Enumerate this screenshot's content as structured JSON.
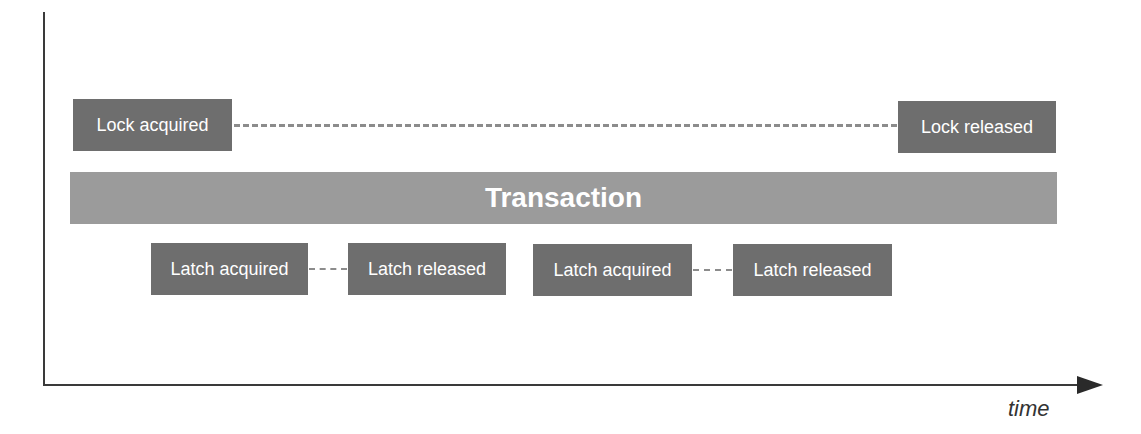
{
  "diagram": {
    "axis": {
      "x_label": "time"
    },
    "transaction": {
      "label": "Transaction"
    },
    "lock": {
      "acquired": "Lock acquired",
      "released": "Lock released"
    },
    "latches": [
      {
        "acquired": "Latch acquired",
        "released": "Latch released"
      },
      {
        "acquired": "Latch acquired",
        "released": "Latch released"
      }
    ],
    "colors": {
      "box": "#6e6e6e",
      "transaction": "#9b9b9b",
      "axis": "#3a3a3a",
      "dash": "#8c8c8c"
    }
  }
}
